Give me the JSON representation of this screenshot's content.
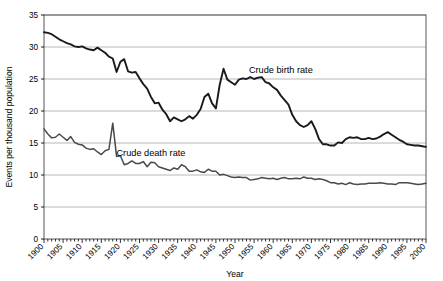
{
  "chart_data": {
    "type": "line",
    "title": "",
    "xlabel": "Year",
    "ylabel": "Events per thousand population",
    "xlim": [
      1900,
      2000
    ],
    "ylim": [
      0,
      35
    ],
    "ytick_step": 5,
    "xtick_step": 5,
    "minor_xtick_step": 1,
    "grid": "horizontal",
    "legend_position": "inline-annotations",
    "yticks": [
      "0",
      "5",
      "10",
      "15",
      "20",
      "25",
      "30",
      "35"
    ],
    "xticks": [
      "1900",
      "1905",
      "1910",
      "1915",
      "1920",
      "1925",
      "1930",
      "1935",
      "1940",
      "1945",
      "1950",
      "1955",
      "1960",
      "1965",
      "1970",
      "1975",
      "1980",
      "1985",
      "1990",
      "1995",
      "2000"
    ],
    "series": [
      {
        "name": "Crude birth rate",
        "label": "Crude birth rate",
        "color": "#1a1a1a",
        "label_x": 1962,
        "label_y": 26.0,
        "x": [
          1900,
          1901,
          1902,
          1903,
          1904,
          1905,
          1906,
          1907,
          1908,
          1909,
          1910,
          1911,
          1912,
          1913,
          1914,
          1915,
          1916,
          1917,
          1918,
          1919,
          1920,
          1921,
          1922,
          1923,
          1924,
          1925,
          1926,
          1927,
          1928,
          1929,
          1930,
          1931,
          1932,
          1933,
          1934,
          1935,
          1936,
          1937,
          1938,
          1939,
          1940,
          1941,
          1942,
          1943,
          1944,
          1945,
          1946,
          1947,
          1948,
          1949,
          1950,
          1951,
          1952,
          1953,
          1954,
          1955,
          1956,
          1957,
          1958,
          1959,
          1960,
          1961,
          1962,
          1963,
          1964,
          1965,
          1966,
          1967,
          1968,
          1969,
          1970,
          1971,
          1972,
          1973,
          1974,
          1975,
          1976,
          1977,
          1978,
          1979,
          1980,
          1981,
          1982,
          1983,
          1984,
          1985,
          1986,
          1987,
          1988,
          1989,
          1990,
          1991,
          1992,
          1993,
          1994,
          1995,
          1996,
          1997,
          1998,
          1999,
          2000
        ],
        "values": [
          32.3,
          32.2,
          32.0,
          31.6,
          31.2,
          30.9,
          30.6,
          30.4,
          30.1,
          30.0,
          30.1,
          29.8,
          29.6,
          29.5,
          29.9,
          29.5,
          29.1,
          28.5,
          28.2,
          26.1,
          27.7,
          28.1,
          26.2,
          26.0,
          26.1,
          25.1,
          24.2,
          23.5,
          22.2,
          21.2,
          21.3,
          20.2,
          19.5,
          18.4,
          19.0,
          18.7,
          18.4,
          18.7,
          19.2,
          18.8,
          19.4,
          20.3,
          22.2,
          22.7,
          21.2,
          20.4,
          24.1,
          26.6,
          24.9,
          24.5,
          24.1,
          24.9,
          25.1,
          25.0,
          25.3,
          25.0,
          25.2,
          25.3,
          24.5,
          24.3,
          23.7,
          23.3,
          22.4,
          21.7,
          21.0,
          19.4,
          18.4,
          17.8,
          17.5,
          17.8,
          18.4,
          17.2,
          15.6,
          14.8,
          14.8,
          14.6,
          14.6,
          15.1,
          15.0,
          15.6,
          15.9,
          15.8,
          15.9,
          15.6,
          15.6,
          15.8,
          15.6,
          15.7,
          16.0,
          16.4,
          16.7,
          16.3,
          15.9,
          15.5,
          15.2,
          14.8,
          14.7,
          14.6,
          14.6,
          14.5,
          14.4
        ]
      },
      {
        "name": "Crude death rate",
        "label": "Crude death rate",
        "color": "#4a4a4a",
        "label_x": 1928,
        "label_y": 13.0,
        "x": [
          1900,
          1901,
          1902,
          1903,
          1904,
          1905,
          1906,
          1907,
          1908,
          1909,
          1910,
          1911,
          1912,
          1913,
          1914,
          1915,
          1916,
          1917,
          1918,
          1919,
          1920,
          1921,
          1922,
          1923,
          1924,
          1925,
          1926,
          1927,
          1928,
          1929,
          1930,
          1931,
          1932,
          1933,
          1934,
          1935,
          1936,
          1937,
          1938,
          1939,
          1940,
          1941,
          1942,
          1943,
          1944,
          1945,
          1946,
          1947,
          1948,
          1949,
          1950,
          1951,
          1952,
          1953,
          1954,
          1955,
          1956,
          1957,
          1958,
          1959,
          1960,
          1961,
          1962,
          1963,
          1964,
          1965,
          1966,
          1967,
          1968,
          1969,
          1970,
          1971,
          1972,
          1973,
          1974,
          1975,
          1976,
          1977,
          1978,
          1979,
          1980,
          1981,
          1982,
          1983,
          1984,
          1985,
          1986,
          1987,
          1988,
          1989,
          1990,
          1991,
          1992,
          1993,
          1994,
          1995,
          1996,
          1997,
          1998,
          1999,
          2000
        ],
        "values": [
          17.2,
          16.4,
          15.8,
          15.9,
          16.4,
          15.9,
          15.4,
          16.0,
          15.1,
          14.8,
          14.7,
          14.2,
          14.0,
          14.1,
          13.6,
          13.2,
          13.8,
          14.0,
          18.1,
          12.9,
          13.0,
          11.6,
          11.8,
          12.2,
          11.8,
          11.8,
          12.1,
          11.3,
          12.0,
          11.9,
          11.3,
          11.1,
          10.9,
          10.7,
          11.1,
          10.9,
          11.6,
          11.3,
          10.6,
          10.6,
          10.8,
          10.5,
          10.4,
          10.9,
          10.6,
          10.6,
          10.0,
          10.1,
          9.9,
          9.7,
          9.6,
          9.7,
          9.6,
          9.6,
          9.2,
          9.3,
          9.4,
          9.6,
          9.5,
          9.4,
          9.5,
          9.3,
          9.5,
          9.6,
          9.4,
          9.4,
          9.5,
          9.4,
          9.7,
          9.5,
          9.5,
          9.3,
          9.4,
          9.3,
          9.1,
          8.8,
          8.8,
          8.6,
          8.7,
          8.5,
          8.8,
          8.6,
          8.5,
          8.6,
          8.6,
          8.7,
          8.7,
          8.7,
          8.8,
          8.7,
          8.6,
          8.6,
          8.5,
          8.8,
          8.8,
          8.8,
          8.7,
          8.6,
          8.5,
          8.6,
          8.7
        ]
      }
    ]
  }
}
